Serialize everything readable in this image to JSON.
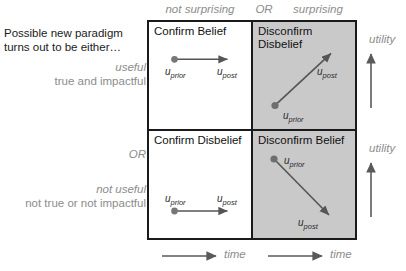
{
  "diagram": {
    "title_lines": [
      "Possible new paradigm",
      "turns out to be either…"
    ],
    "or_divider_label": "OR",
    "row_labels": [
      {
        "emphasis": "useful",
        "detail": "true and impactful"
      },
      {
        "emphasis": "not useful",
        "detail": "not true or not impactful"
      }
    ],
    "column_headers": {
      "left": "not surprising",
      "divider": "OR",
      "right": "surprising"
    },
    "quadrants": [
      {
        "id": "confirm-belief",
        "title": "Confirm Belief",
        "shaded": false,
        "prior_label": "u",
        "prior_sub": "prior",
        "post_label": "u",
        "post_sub": "post",
        "direction": "horizontal-right"
      },
      {
        "id": "disconfirm-disbelief",
        "title": "Disconfirm\nDisbelief",
        "shaded": true,
        "prior_label": "u",
        "prior_sub": "prior",
        "post_label": "u",
        "post_sub": "post",
        "direction": "diagonal-up-right"
      },
      {
        "id": "confirm-disbelief",
        "title": "Confirm Disbelief",
        "shaded": false,
        "prior_label": "u",
        "prior_sub": "prior",
        "post_label": "u",
        "post_sub": "post",
        "direction": "horizontal-right"
      },
      {
        "id": "disconfirm-belief",
        "title": "Disconfirm Belief",
        "shaded": true,
        "prior_label": "u",
        "prior_sub": "prior",
        "post_label": "u",
        "post_sub": "post",
        "direction": "diagonal-down-right"
      }
    ],
    "axes": {
      "utility_top": "utility",
      "utility_bottom": "utility",
      "time_left": "time",
      "time_right": "time"
    },
    "colors": {
      "shaded_cell": "#c9c9c9",
      "border": "#1a1a1a",
      "muted_text": "#8c8c8c",
      "body_text": "#1a1a1a",
      "arrow": "#555555"
    }
  }
}
